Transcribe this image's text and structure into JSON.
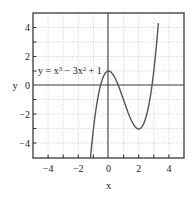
{
  "chart_data": {
    "type": "line",
    "title": "",
    "annotation": "y = x³ − 3x² + 1",
    "equation_parts": {
      "lead": "y = x",
      "exp1": "3",
      "mid": " − 3x",
      "exp2": "2",
      "tail": " + 1"
    },
    "xlabel": "x",
    "ylabel": "y",
    "xlim": [
      -5,
      5
    ],
    "ylim": [
      -5,
      5
    ],
    "xticks": [
      "−4",
      "−2",
      "0",
      "2",
      "4"
    ],
    "xtick_values": [
      -4,
      -2,
      0,
      2,
      4
    ],
    "yticks": [
      "4",
      "2",
      "0",
      "−2",
      "−4"
    ],
    "ytick_values": [
      4,
      2,
      0,
      -2,
      -4
    ],
    "grid": true,
    "grid_style": "dotted",
    "grid_spacing": 1,
    "legend": "none",
    "series": [
      {
        "name": "y = x³ − 3x² + 1",
        "expression": "x^3 - 3*x^2 + 1",
        "color": "#555555",
        "key_points": {
          "local_max": [
            0,
            1
          ],
          "local_min": [
            2,
            -3
          ],
          "y_intercept": [
            0,
            1
          ]
        },
        "x": [
          -1.2,
          -1.1,
          -1.0,
          -0.9,
          -0.8,
          -0.7,
          -0.6,
          -0.5,
          -0.4,
          -0.3,
          -0.2,
          -0.1,
          0.0,
          0.1,
          0.2,
          0.3,
          0.4,
          0.5,
          0.6,
          0.7,
          0.8,
          0.9,
          1.0,
          1.1,
          1.2,
          1.3,
          1.4,
          1.5,
          1.6,
          1.7,
          1.8,
          1.9,
          2.0,
          2.1,
          2.2,
          2.3,
          2.4,
          2.5,
          2.6,
          2.7,
          2.8,
          2.9,
          3.0,
          3.1,
          3.2,
          3.3
        ],
        "y": [
          -5.048,
          -3.961,
          -3.0,
          -2.159,
          -1.432,
          -0.813,
          -0.296,
          0.125,
          0.456,
          0.703,
          0.872,
          0.969,
          1.0,
          0.971,
          0.888,
          0.757,
          0.584,
          0.375,
          0.136,
          -0.127,
          -0.408,
          -0.701,
          -1.0,
          -1.299,
          -1.592,
          -1.873,
          -2.136,
          -2.375,
          -2.584,
          -2.757,
          -2.888,
          -2.971,
          -3.0,
          -2.969,
          -2.872,
          -2.703,
          -2.456,
          -2.125,
          -1.704,
          -1.187,
          -0.568,
          0.159,
          1.0,
          1.961,
          3.048,
          4.267
        ]
      }
    ]
  },
  "plot_geometry": {
    "frame_left": 33,
    "frame_right": 184,
    "frame_top": 13,
    "frame_bottom": 158,
    "origin_x_px": 108,
    "origin_y_px": 85
  },
  "colors": {
    "background": "#ffffff",
    "frame": "#3a3a3a",
    "axis": "#3a3a3a",
    "grid": "#b9b9b9",
    "curve": "#555555",
    "text": "#1a1a1a"
  }
}
